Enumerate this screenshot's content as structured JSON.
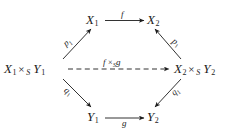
{
  "diagram": {
    "type": "commutative-diagram",
    "background_color": "#ffffff",
    "stroke_color": "#1c1c1c",
    "nodes": [
      {
        "id": "top-left",
        "base": "X",
        "sub": "1",
        "text": "X₁"
      },
      {
        "id": "top-right",
        "base": "X",
        "sub": "2",
        "text": "X₂"
      },
      {
        "id": "middle-left",
        "left_base": "X",
        "left_sub": "1",
        "times": "×",
        "times_sub": "S",
        "right_base": "Y",
        "right_sub": "1",
        "text": "X₁ ×_S Y₁"
      },
      {
        "id": "middle-right",
        "left_base": "X",
        "left_sub": "2",
        "times": "×",
        "times_sub": "S",
        "right_base": "Y",
        "right_sub": "2",
        "text": "X₂ ×_S Y₂"
      },
      {
        "id": "bottom-left",
        "base": "Y",
        "sub": "1",
        "text": "Y₁"
      },
      {
        "id": "bottom-right",
        "base": "Y",
        "sub": "2",
        "text": "Y₂"
      }
    ],
    "arrows": [
      {
        "id": "top-horizontal",
        "from": "top-left",
        "to": "top-right",
        "style": "solid",
        "label_base": "f",
        "label_sub": ""
      },
      {
        "id": "upper-left-diagonal",
        "from": "middle-left",
        "to": "top-left",
        "style": "solid",
        "label_base": "p",
        "label_sub": "1"
      },
      {
        "id": "upper-right-diagonal",
        "from": "middle-right",
        "to": "top-right",
        "style": "solid",
        "label_base": "p",
        "label_sub": "1"
      },
      {
        "id": "lower-left-diagonal",
        "from": "middle-left",
        "to": "bottom-left",
        "style": "solid",
        "label_base": "q",
        "label_sub": "1"
      },
      {
        "id": "lower-right-diagonal",
        "from": "middle-right",
        "to": "bottom-right",
        "style": "solid",
        "label_base": "q",
        "label_sub": "1"
      },
      {
        "id": "middle-dashed",
        "from": "middle-left",
        "to": "middle-right",
        "style": "dashed",
        "label_base": "f",
        "label_times": "×",
        "label_times_sub": "S",
        "label_base2": "g"
      },
      {
        "id": "bottom-horizontal",
        "from": "bottom-left",
        "to": "bottom-right",
        "style": "solid",
        "label_base": "g",
        "label_sub": ""
      }
    ]
  }
}
